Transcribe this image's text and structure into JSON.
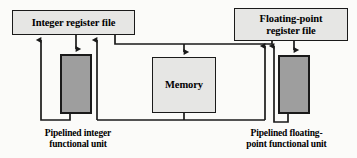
{
  "diagram": {
    "colors": {
      "background": "#fbfbf9",
      "box_light_fill": "#e6e6e4",
      "box_dark_fill": "#9e9e9e",
      "stroke": "#1a1a1a",
      "text": "#000000"
    },
    "nodes": [
      {
        "id": "int-reg-file",
        "label": "Integer register file",
        "style": "light",
        "x": 12,
        "y": 10,
        "w": 123,
        "h": 25
      },
      {
        "id": "fp-reg-file",
        "label_line1": "Floating-point",
        "label_line2": "register file",
        "style": "light",
        "x": 234,
        "y": 8,
        "w": 114,
        "h": 33
      },
      {
        "id": "memory-box",
        "label": "Memory",
        "style": "light",
        "x": 152,
        "y": 57,
        "w": 64,
        "h": 56
      },
      {
        "id": "int-func-unit",
        "label": "",
        "style": "dark",
        "x": 60,
        "y": 54,
        "w": 32,
        "h": 60
      },
      {
        "id": "fp-func-unit",
        "label": "",
        "style": "dark",
        "x": 278,
        "y": 55,
        "w": 32,
        "h": 59
      }
    ],
    "captions": [
      {
        "id": "int-caption",
        "line1": "Pipelined integer",
        "line2": "functional unit",
        "for": "int-func-unit"
      },
      {
        "id": "fp-caption",
        "line1": "Pipelined floating-",
        "line2": "point functional unit",
        "for": "fp-func-unit"
      }
    ],
    "connections": [
      {
        "from": "int-func-unit",
        "to": "int-reg-file",
        "direction": "up",
        "kind": "result-writeback"
      },
      {
        "from": "int-reg-file",
        "to": "int-func-unit",
        "direction": "down",
        "kind": "operand-read"
      },
      {
        "from": "memory-bus",
        "to": "int-reg-file",
        "direction": "up",
        "kind": "load-to-integer"
      },
      {
        "from": "int-reg-file",
        "to": "memory",
        "direction": "bus",
        "kind": "store-bus"
      },
      {
        "from": "bus",
        "to": "memory-box",
        "direction": "down",
        "kind": "memory-input"
      },
      {
        "from": "memory-box",
        "to": "memory-bus",
        "direction": "down",
        "kind": "memory-output"
      },
      {
        "from": "memory-bus",
        "to": "fp-reg-file",
        "direction": "up",
        "kind": "load-to-fp"
      },
      {
        "from": "fp-func-unit",
        "to": "fp-reg-file",
        "direction": "up",
        "kind": "result-writeback"
      },
      {
        "from": "fp-reg-file",
        "to": "fp-func-unit",
        "direction": "down",
        "kind": "operand-read"
      }
    ]
  }
}
